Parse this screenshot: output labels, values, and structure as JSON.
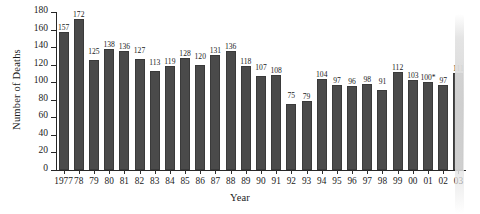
{
  "chart_data": {
    "type": "bar",
    "title": "",
    "xlabel": "Year",
    "ylabel": "Number of Deaths",
    "ylim": [
      0,
      180
    ],
    "ytick_step": 20,
    "yticks": [
      0,
      20,
      40,
      60,
      80,
      100,
      120,
      140,
      160,
      180
    ],
    "grid": false,
    "legend": null,
    "categories": [
      "1977",
      "78",
      "79",
      "80",
      "81",
      "82",
      "83",
      "84",
      "85",
      "86",
      "87",
      "88",
      "89",
      "90",
      "91",
      "92",
      "93",
      "94",
      "95",
      "96",
      "97",
      "98",
      "99",
      "00",
      "01",
      "02",
      "03"
    ],
    "values": [
      157,
      172,
      125,
      138,
      136,
      127,
      113,
      119,
      128,
      120,
      131,
      136,
      118,
      107,
      108,
      75,
      79,
      104,
      97,
      96,
      98,
      91,
      112,
      103,
      100,
      97,
      111
    ],
    "value_labels": [
      "157",
      "172",
      "125",
      "138",
      "136",
      "127",
      "113",
      "119",
      "128",
      "120",
      "131",
      "136",
      "118",
      "107",
      "108",
      "75",
      "79",
      "104",
      "97",
      "96",
      "98",
      "91",
      "112",
      "103",
      "100*",
      "97",
      "111"
    ],
    "annotations": [
      "* asterisk on the year 01 value label"
    ],
    "bar_color": "#4a4a4a",
    "axis_color": "#262626",
    "background_color": "#ffffff"
  },
  "artifact": {
    "name": "scan-streak",
    "description": "light vertical scanning streak over the rightmost bar",
    "color": "#d6d6d6"
  }
}
